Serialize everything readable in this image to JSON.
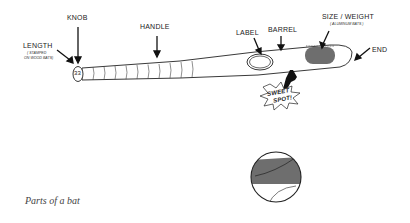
{
  "diagram": {
    "title": "Parts of a bat",
    "labels": {
      "knob": "KNOB",
      "length": "LENGTH",
      "length_note_1": "( STAMPED",
      "length_note_2": "ON WOOD BATS)",
      "handle": "HANDLE",
      "label": "LABEL",
      "barrel": "BARREL",
      "size_weight": "SIZE / WEIGHT",
      "size_weight_note": "( ALUMINUM BATS )",
      "end": "END",
      "sweet_spot_1": "SWEET",
      "sweet_spot_2": "SPOT!"
    },
    "knob_number": "33",
    "colors": {
      "line": "#222222",
      "fill_gray": "#6e6e6e",
      "caption": "#444444"
    }
  }
}
